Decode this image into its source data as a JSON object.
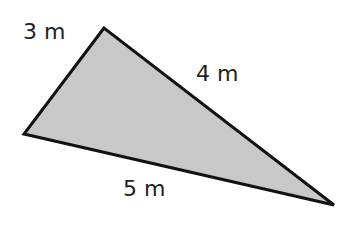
{
  "diagram": {
    "type": "triangle",
    "fill_color": "#c8c8c8",
    "stroke_color": "#111111",
    "vertices": {
      "top": [
        104,
        28
      ],
      "left": [
        24,
        134
      ],
      "right": [
        334,
        205
      ]
    },
    "side_labels": [
      {
        "id": "side-a",
        "text": "3 m",
        "x": 23,
        "y": 21
      },
      {
        "id": "side-b",
        "text": "4 m",
        "x": 196,
        "y": 63
      },
      {
        "id": "side-c",
        "text": "5 m",
        "x": 123,
        "y": 178
      }
    ]
  }
}
